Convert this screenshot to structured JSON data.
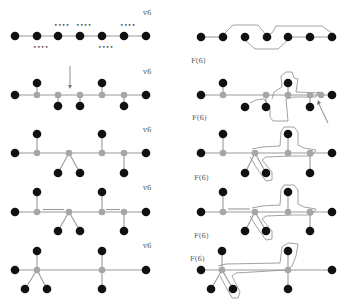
{
  "labels": {
    "v6": "v6",
    "f6": "F(6)",
    "dots": "••••"
  },
  "colors": {
    "leaf_node": "#111111",
    "internal_node": "#a6a6a6",
    "edge": "#9a9a9a",
    "outline": "#8a8a8a"
  },
  "left_column": [
    {
      "panel": 1,
      "label": "v6",
      "description": "path of 7 black vertices with dotted markers above/below"
    },
    {
      "panel": 2,
      "label": "v6",
      "description": "caterpillar with grey spine vertices and black leaves, arrow above"
    },
    {
      "panel": 3,
      "label": "v6",
      "description": "tree with merged branch vertex"
    },
    {
      "panel": 4,
      "label": "v6",
      "description": "tree with double-line segments"
    },
    {
      "panel": 5,
      "label": "v6",
      "description": "tree with two grey hub vertices"
    }
  ],
  "right_column": [
    {
      "panel": 1,
      "label": "F(6)",
      "description": "path with closed outline curve"
    },
    {
      "panel": 2,
      "label": "F(6)",
      "description": "caterpillar with outline region and arrow"
    },
    {
      "panel": 3,
      "label": "F(6)",
      "description": "tree with outline region"
    },
    {
      "panel": 4,
      "label": "F(6)",
      "description": "tree with outline region"
    },
    {
      "panel": 5,
      "label": "F(6)",
      "description": "tree with outline region"
    }
  ]
}
